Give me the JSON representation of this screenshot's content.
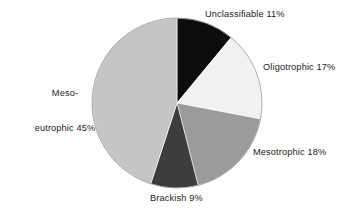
{
  "chart_data": {
    "type": "pie",
    "title": "",
    "subtitle": "",
    "xlabel": "",
    "ylabel": "",
    "legend_position": "none",
    "grid": false,
    "unit": "%",
    "total": 100,
    "start_angle_deg": 0,
    "direction": "clockwise",
    "categories": [
      "Unclassifiable",
      "Oligotrophic",
      "Mesotrophic",
      "Brackish",
      "Meso-eutrophic"
    ],
    "values": [
      11,
      17,
      18,
      9,
      45
    ],
    "colors": [
      "#0d0d0d",
      "#f1f1f1",
      "#9b9b9b",
      "#3d3d3d",
      "#c5c5c5"
    ],
    "slices": [
      {
        "name": "Unclassifiable",
        "value": 11,
        "label": "Unclassifiable 11%",
        "color": "#0d0d0d",
        "start_deg": 0,
        "end_deg": 39.6
      },
      {
        "name": "Oligotrophic",
        "value": 17,
        "label": "Oligotrophic 17%",
        "color": "#f1f1f1",
        "start_deg": 39.6,
        "end_deg": 100.8
      },
      {
        "name": "Mesotrophic",
        "value": 18,
        "label": "Mesotrophic 18%",
        "color": "#9b9b9b",
        "start_deg": 100.8,
        "end_deg": 165.6
      },
      {
        "name": "Brackish",
        "value": 9,
        "label": "Brackish 9%",
        "color": "#3d3d3d",
        "start_deg": 165.6,
        "end_deg": 198.0
      },
      {
        "name": "Meso-eutrophic",
        "value": 45,
        "label": "Meso-\neutrophic 45%",
        "color": "#c5c5c5",
        "start_deg": 198.0,
        "end_deg": 360.0
      }
    ]
  },
  "labels": {
    "unclassifiable": "Unclassifiable 11%",
    "oligotrophic": "Oligotrophic 17%",
    "mesotrophic": "Mesotrophic 18%",
    "brackish": "Brackish 9%",
    "meso_eutrophic_line1": "Meso-",
    "meso_eutrophic_line2": "eutrophic 45%"
  },
  "geometry": {
    "cx": 177,
    "cy": 103,
    "r": 85
  }
}
